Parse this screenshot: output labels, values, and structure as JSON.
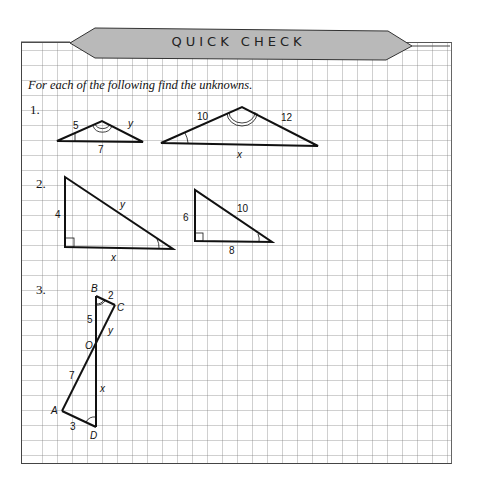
{
  "header": {
    "title": "QUICK CHECK"
  },
  "instruction": "For each of the following find the unknowns.",
  "problems": [
    {
      "number": "1.",
      "figures": [
        {
          "sides": {
            "left": "5",
            "right": "y",
            "bottom": "7"
          }
        },
        {
          "sides": {
            "left": "10",
            "right": "12",
            "bottom": "x"
          }
        }
      ]
    },
    {
      "number": "2.",
      "figures": [
        {
          "sides": {
            "vertical": "4",
            "hypotenuse": "y",
            "bottom": "x"
          }
        },
        {
          "sides": {
            "vertical": "6",
            "hypotenuse": "10",
            "bottom": "8"
          }
        }
      ]
    },
    {
      "number": "3.",
      "figure": {
        "vertices": {
          "b": "B",
          "c": "C",
          "o": "O",
          "a": "A",
          "d": "D"
        },
        "sides": {
          "bc": "2",
          "bo": "5",
          "co": "y",
          "ao": "7",
          "do": "x",
          "ad": "3"
        }
      }
    }
  ]
}
